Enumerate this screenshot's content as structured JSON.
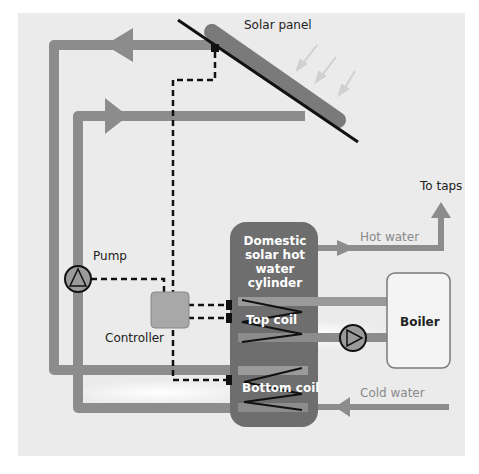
{
  "diagram": {
    "labels": {
      "solar_panel": "Solar panel",
      "to_taps": "To taps",
      "hot_water": "Hot water",
      "pump": "Pump",
      "controller": "Controller",
      "tank": "Domestic solar hot water cylinder",
      "top_coil": "Top coil",
      "bottom_coil": "Bottom coil",
      "boiler": "Boiler",
      "cold_water": "Cold water"
    },
    "colors": {
      "background": "#ebebeb",
      "pipe": "#8c8c8c",
      "tank": "#6e6e6e",
      "panel": "#7a7a7a",
      "controller": "#a8a8a8",
      "control_wire": "#111111"
    }
  }
}
